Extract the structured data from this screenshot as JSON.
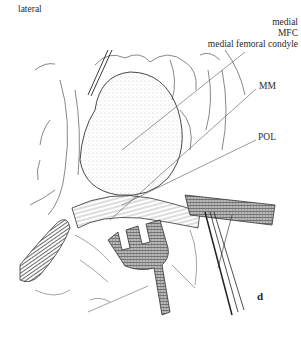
{
  "figure": {
    "type": "surgical anatomical line illustration",
    "panel_letter": "d",
    "labels": {
      "top_left": "lateral",
      "top_right_1": "medial",
      "top_right_2": "MFC",
      "top_right_3": "medial femoral condyle",
      "right_1": "MM",
      "right_2": "POL"
    },
    "colors": {
      "ink": "#2a2a2a",
      "background": "#ffffff",
      "stipple": "#9a9a9a",
      "retractor_fill": "#8a8a8a"
    }
  }
}
